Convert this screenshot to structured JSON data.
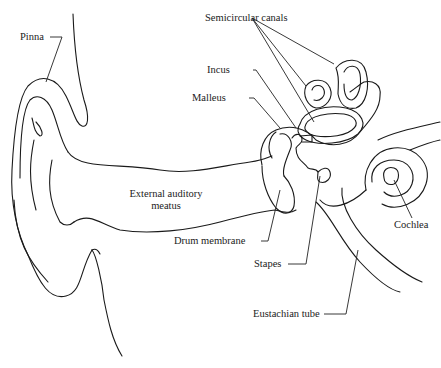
{
  "diagram": {
    "labels": {
      "pinna": "Pinna",
      "semicircular_canals": "Semicircular canals",
      "incus": "Incus",
      "malleus": "Malleus",
      "external_meatus_line1": "External auditory",
      "external_meatus_line2": "meatus",
      "drum_membrane": "Drum membrane",
      "stapes": "Stapes",
      "cochlea": "Cochlea",
      "eustachian_tube": "Eustachian tube"
    },
    "colors": {
      "line": "#1a1a1a",
      "background": "#ffffff"
    }
  }
}
